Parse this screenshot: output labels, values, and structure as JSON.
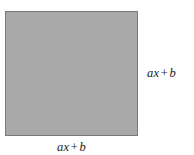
{
  "figure": {
    "type": "geometry-diagram",
    "background_color": "#ffffff",
    "shape": {
      "name": "square",
      "fill_color": "#a9a9a9",
      "stroke_color": "#787878",
      "stroke_width": 1,
      "x": 5,
      "y": 11,
      "width": 133,
      "height": 125
    },
    "labels": {
      "right": {
        "text": "ax + b",
        "parts": {
          "coefficient_term": "ax",
          "operator": "+",
          "constant_term": "b"
        },
        "position": "right-of-square",
        "style": "math-italic-serif",
        "color": "#1a1a1a"
      },
      "bottom": {
        "text": "ax + b",
        "parts": {
          "coefficient_term": "ax",
          "operator": "+",
          "constant_term": "b"
        },
        "position": "below-square",
        "style": "math-italic-serif",
        "color": "#1a1a1a"
      }
    }
  }
}
